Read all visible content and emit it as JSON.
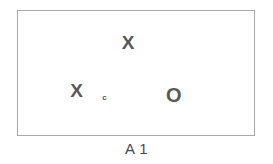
{
  "figure": {
    "caption": "A 1",
    "frame": {
      "name": "bounding-box",
      "border_color": "#a8a8a8",
      "background_color": "#ffffff"
    },
    "mark_color": "#595959",
    "marks": [
      {
        "id": "x-top",
        "glyph": "X",
        "type": "x",
        "x_pct": 46.6,
        "y_pct": 24.6
      },
      {
        "id": "x-left",
        "glyph": "X",
        "type": "x",
        "x_pct": 24.8,
        "y_pct": 63.5
      },
      {
        "id": "tick-mid",
        "glyph": "c",
        "type": "tiny",
        "x_pct": 36.6,
        "y_pct": 69.8
      },
      {
        "id": "o-right",
        "glyph": "O",
        "type": "o",
        "x_pct": 66.0,
        "y_pct": 67.5
      }
    ]
  },
  "chart_data": {
    "type": "scatter",
    "title": "A 1",
    "xlabel": "",
    "ylabel": "",
    "xlim": [
      0,
      100
    ],
    "ylim": [
      0,
      100
    ],
    "grid": false,
    "legend": null,
    "series": [
      {
        "name": "X marks",
        "marker": "X",
        "color": "#595959",
        "points": [
          {
            "x": 46.6,
            "y": 75.4
          },
          {
            "x": 24.8,
            "y": 36.5
          }
        ]
      },
      {
        "name": "O marks",
        "marker": "O",
        "color": "#595959",
        "points": [
          {
            "x": 66.0,
            "y": 32.5
          }
        ]
      },
      {
        "name": "small mark",
        "marker": "c",
        "color": "#595959",
        "points": [
          {
            "x": 36.6,
            "y": 30.2
          }
        ]
      }
    ]
  }
}
